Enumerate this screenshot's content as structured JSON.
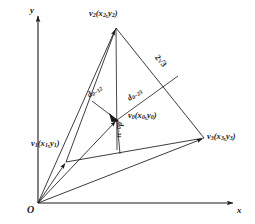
{
  "figure": {
    "type": "geometry-diagram",
    "axes": {
      "x_label": "x",
      "y_label": "y",
      "origin_label": "O"
    },
    "points": [
      {
        "id": "v1",
        "label": "v",
        "sub": "1",
        "coords": "(x₁,y₁)",
        "text": "v₁(x₁,y₁)",
        "x": 66,
        "y": 162
      },
      {
        "id": "v2",
        "label": "v",
        "sub": "2",
        "coords": "(x₂,y₂)",
        "text": "v₂(x₂,y₂)",
        "x": 116,
        "y": 28
      },
      {
        "id": "v3",
        "label": "v",
        "sub": "3",
        "coords": "(x₃,y₃)",
        "text": "v₃(x₃,y₃)",
        "x": 204,
        "y": 138
      },
      {
        "id": "v0",
        "label": "v",
        "sub": "0",
        "coords": "(x₀,y₀)",
        "text": "v₀(x₀,y₀)",
        "x": 117,
        "y": 120
      }
    ],
    "labels": {
      "v1": {
        "main": "v",
        "sub1": "1",
        "open": "(x",
        "sub2": "1",
        "comma": ",y",
        "sub3": "1",
        "close": ")"
      },
      "v2": {
        "main": "v",
        "sub1": "2",
        "open": "(x",
        "sub2": "2",
        "comma": ",y",
        "sub3": "2",
        "close": ")"
      },
      "v3": {
        "main": "v",
        "sub1": "3",
        "open": "(x",
        "sub2": "3",
        "comma": ",y",
        "sub3": "3",
        "close": ")"
      },
      "v0": {
        "main": "v",
        "sub1": "0",
        "open": "(x",
        "sub2": "0",
        "comma": ",y",
        "sub3": "0",
        "close": ")"
      }
    },
    "distances": [
      {
        "id": "d0_12",
        "main": "d",
        "sub": "0−12",
        "text": "d₀₋₁₂",
        "from": "v0",
        "to_edge": "v1v2"
      },
      {
        "id": "d0_23",
        "main": "d",
        "sub": "0−23",
        "text": "d₀₋₂₃",
        "from": "v0",
        "to_edge": "v2v3"
      },
      {
        "id": "d0_31",
        "main": "d",
        "sub": "0−31",
        "text": "d₀₋₃₁",
        "from": "v0",
        "to_edge": "v3v1"
      }
    ],
    "edge_lengths": [
      {
        "id": "len_v2v3",
        "text": "2√3",
        "coefficient": "2",
        "radicand": "3",
        "edge": "v2v3"
      }
    ],
    "colors": {
      "stroke": "#1a1a1a",
      "text": "#1a1a1a",
      "background": "#ffffff"
    }
  }
}
